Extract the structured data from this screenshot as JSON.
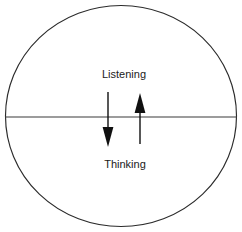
{
  "diagram": {
    "background_color": "#ffffff",
    "stroke_color": "#2b2b2b",
    "labels": {
      "upper": "Listening",
      "lower": "Thinking"
    },
    "circle": {
      "center_x": 121,
      "center_y": 116,
      "radius_x": 116,
      "radius_y": 111
    },
    "divider": {
      "name": "horizontal-divider",
      "y": 117,
      "x_start": 5,
      "x_end": 237
    },
    "arrows": [
      {
        "name": "downward-arrow",
        "direction": "down",
        "x": 108,
        "y_start": 92,
        "y_end": 146,
        "color": "#101010"
      },
      {
        "name": "upward-arrow",
        "direction": "up",
        "x": 140,
        "y_start": 144,
        "y_end": 94,
        "color": "#101010"
      }
    ],
    "label_positions": {
      "upper_x": 124,
      "upper_y": 78,
      "lower_x": 125,
      "lower_y": 168
    }
  }
}
